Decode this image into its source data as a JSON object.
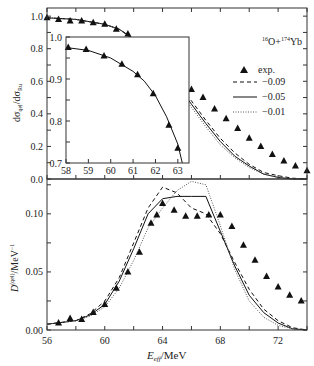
{
  "chart_data": [
    {
      "type": "line",
      "panel": "upper",
      "title": "",
      "annotation": "16O+174Yb",
      "xlabel": "",
      "ylabel": "dσqel/dσRu",
      "xlim": [
        56,
        74
      ],
      "ylim": [
        0.0,
        1.05
      ],
      "yticks": [
        "0.0",
        "0.2",
        "0.4",
        "0.6",
        "0.8",
        "1.0"
      ],
      "legend": [
        "exp.",
        "−0.09",
        "−0.05",
        "−0.01"
      ],
      "legend_position": "upper right",
      "exp": {
        "x": [
          56.0,
          56.8,
          57.6,
          58.4,
          59.2,
          60.0,
          60.8,
          61.6,
          62.4,
          63.0,
          63.6,
          64.4,
          65.2,
          66.0,
          66.8,
          67.6,
          68.4,
          69.2,
          70.0,
          70.8,
          71.6,
          72.4,
          73.2,
          74.0
        ],
        "y": [
          0.99,
          0.98,
          0.97,
          0.97,
          0.96,
          0.95,
          0.92,
          0.89,
          0.84,
          0.79,
          0.73,
          0.68,
          0.61,
          0.55,
          0.5,
          0.43,
          0.37,
          0.31,
          0.25,
          0.2,
          0.15,
          0.11,
          0.08,
          0.05
        ]
      },
      "series": [
        {
          "name": "−0.09",
          "style": "dashed",
          "x": [
            56,
            58,
            60,
            61,
            62,
            63,
            64,
            65,
            66,
            67,
            68,
            69,
            70,
            71,
            72,
            73,
            74
          ],
          "y": [
            0.99,
            0.98,
            0.95,
            0.92,
            0.86,
            0.79,
            0.7,
            0.59,
            0.48,
            0.36,
            0.25,
            0.16,
            0.09,
            0.04,
            0.02,
            0.005,
            0.0
          ]
        },
        {
          "name": "−0.05",
          "style": "solid",
          "x": [
            56,
            58,
            60,
            61,
            62,
            63,
            64,
            65,
            66,
            67,
            68,
            69,
            70,
            71,
            72,
            73,
            74
          ],
          "y": [
            0.99,
            0.98,
            0.95,
            0.92,
            0.86,
            0.78,
            0.69,
            0.58,
            0.46,
            0.34,
            0.23,
            0.14,
            0.08,
            0.03,
            0.01,
            0.0,
            0.0
          ]
        },
        {
          "name": "−0.01",
          "style": "dotted",
          "x": [
            56,
            58,
            60,
            61,
            62,
            63,
            64,
            65,
            66,
            67,
            68,
            69,
            70,
            71,
            72,
            73,
            74
          ],
          "y": [
            0.99,
            0.98,
            0.95,
            0.92,
            0.85,
            0.77,
            0.68,
            0.56,
            0.44,
            0.32,
            0.21,
            0.13,
            0.07,
            0.03,
            0.01,
            0.0,
            0.0
          ]
        }
      ]
    },
    {
      "type": "line",
      "panel": "inset",
      "xlim": [
        58,
        63.5
      ],
      "ylim": [
        0.7,
        1.0
      ],
      "xticks": [
        "58",
        "59",
        "60",
        "61",
        "62",
        "63"
      ],
      "yticks": [
        "0.7",
        "0.8",
        "0.9",
        "1.0"
      ],
      "exp": {
        "x": [
          58.1,
          58.9,
          59.7,
          60.5,
          61.2,
          61.9,
          62.6,
          63.0
        ],
        "y": [
          0.975,
          0.97,
          0.955,
          0.935,
          0.91,
          0.865,
          0.79,
          0.735
        ]
      },
      "series": [
        {
          "name": "−0.05",
          "style": "solid",
          "x": [
            58,
            59,
            60,
            61,
            61.5,
            62,
            62.5,
            63,
            63.2
          ],
          "y": [
            0.975,
            0.968,
            0.95,
            0.918,
            0.895,
            0.86,
            0.81,
            0.745,
            0.7
          ]
        }
      ]
    },
    {
      "type": "line",
      "panel": "lower",
      "xlabel": "Eeff/MeV",
      "ylabel": "D(qel)/MeV⁻¹",
      "xlim": [
        56,
        74
      ],
      "ylim": [
        0.0,
        0.13
      ],
      "xticks": [
        "56",
        "60",
        "64",
        "68",
        "72"
      ],
      "yticks": [
        "0.00",
        "0.05",
        "0.10"
      ],
      "exp": {
        "x": [
          56.8,
          57.6,
          58.4,
          59.2,
          60.0,
          60.8,
          61.6,
          62.4,
          63.2,
          63.6,
          64.0,
          64.8,
          65.6,
          66.4,
          67.2,
          68.0,
          68.8,
          69.6,
          70.4,
          71.2,
          72.0,
          72.8,
          73.6
        ],
        "y": [
          0.006,
          0.01,
          0.009,
          0.015,
          0.022,
          0.036,
          0.05,
          0.067,
          0.092,
          0.099,
          0.109,
          0.103,
          0.098,
          0.098,
          0.099,
          0.099,
          0.089,
          0.073,
          0.06,
          0.046,
          0.037,
          0.03,
          0.025,
          0.021,
          0.016,
          0.012,
          0.009
        ]
      },
      "series": [
        {
          "name": "−0.09",
          "style": "dashed",
          "x": [
            56,
            58,
            59,
            60,
            61,
            62,
            63,
            64,
            65,
            66,
            67,
            68,
            69,
            70,
            71,
            72,
            73,
            74
          ],
          "y": [
            0.005,
            0.008,
            0.014,
            0.025,
            0.045,
            0.075,
            0.105,
            0.123,
            0.118,
            0.105,
            0.1,
            0.083,
            0.058,
            0.035,
            0.018,
            0.008,
            0.002,
            0.0
          ]
        },
        {
          "name": "−0.05",
          "style": "solid",
          "x": [
            56,
            58,
            59,
            60,
            61,
            62,
            63,
            64,
            65,
            66,
            67,
            68,
            69,
            70,
            71,
            72,
            73,
            74
          ],
          "y": [
            0.005,
            0.008,
            0.013,
            0.022,
            0.042,
            0.07,
            0.1,
            0.113,
            0.115,
            0.115,
            0.115,
            0.085,
            0.055,
            0.03,
            0.015,
            0.006,
            0.001,
            0.0
          ]
        },
        {
          "name": "−0.01",
          "style": "dotted",
          "x": [
            56,
            58,
            59,
            60,
            61,
            62,
            63,
            64,
            65,
            66,
            67,
            68,
            69,
            70,
            71,
            72,
            73,
            74
          ],
          "y": [
            0.005,
            0.008,
            0.012,
            0.02,
            0.036,
            0.06,
            0.088,
            0.105,
            0.12,
            0.128,
            0.125,
            0.09,
            0.052,
            0.025,
            0.011,
            0.004,
            0.001,
            0.0
          ]
        }
      ]
    }
  ],
  "labels": {
    "upper_ylabel_main": "dσ",
    "upper_ylabel_sub": "qel",
    "upper_ylabel_mid": "/dσ",
    "upper_ylabel_sub2": "Ru",
    "reaction_sup1": "16",
    "reaction_o": "O+",
    "reaction_sup2": "174",
    "reaction_yb": "Yb",
    "legend_exp": "exp.",
    "legend_d1": "−0.09",
    "legend_d2": "−0.05",
    "legend_d3": "−0.01",
    "lower_ylabel_main": "D",
    "lower_ylabel_sup": "(qel)",
    "lower_ylabel_unit": "/MeV",
    "lower_ylabel_unit_sup": "−1",
    "xlabel_main": "E",
    "xlabel_sub": "eff",
    "xlabel_unit": "/MeV"
  }
}
